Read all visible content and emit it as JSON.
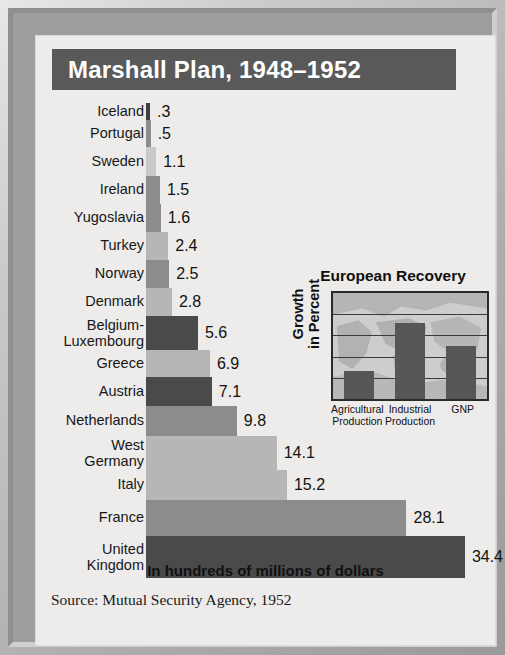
{
  "title": "Marshall Plan, 1948–1952",
  "footer_note": "In hundreds of millions of dollars",
  "source": "Source: Mutual Security Agency, 1952",
  "colors": {
    "title_bar": "#595959",
    "panel": "#edecea",
    "frame": "#9d9d9d",
    "bar_dark": "#4a4a4a",
    "bar_mid": "#8c8c8c",
    "bar_light": "#b6b6b6",
    "bar_pale": "#c9c9c9"
  },
  "inset": {
    "title": "European Recovery",
    "ylabel_line1": "Growth",
    "ylabel_line2": "in Percent"
  },
  "chart_data": [
    {
      "type": "bar",
      "orientation": "horizontal",
      "title": "Marshall Plan, 1948–1952",
      "xlabel": "In hundreds of millions of dollars",
      "ylabel": "",
      "xlim": [
        0,
        34.4
      ],
      "grid": false,
      "legend": "none",
      "categories": [
        "Iceland",
        "Portugal",
        "Sweden",
        "Ireland",
        "Yugoslavia",
        "Turkey",
        "Norway",
        "Denmark",
        "Belgium-Luxembourg",
        "Greece",
        "Austria",
        "Netherlands",
        "West Germany",
        "Italy",
        "France",
        "United Kingdom"
      ],
      "values": [
        0.3,
        0.5,
        1.1,
        1.5,
        1.6,
        2.4,
        2.5,
        2.8,
        5.6,
        6.9,
        7.1,
        9.8,
        14.1,
        15.2,
        28.1,
        34.4
      ],
      "value_labels": [
        ".3",
        ".5",
        "1.1",
        "1.5",
        "1.6",
        "2.4",
        "2.5",
        "2.8",
        "5.6",
        "6.9",
        "7.1",
        "9.8",
        "14.1",
        "15.2",
        "28.1",
        "34.4"
      ]
    },
    {
      "type": "bar",
      "orientation": "vertical",
      "title": "European Recovery",
      "xlabel": "",
      "ylabel": "Growth in Percent",
      "categories": [
        "Agricultural Production",
        "Industrial Production",
        "GNP"
      ],
      "values": [
        13,
        36,
        25
      ],
      "ylim": [
        0,
        50
      ],
      "yticks": [
        0,
        10,
        20,
        30,
        40,
        50
      ],
      "grid": true,
      "legend": "none"
    }
  ],
  "rows": [
    {
      "label": "Iceland",
      "label2": "",
      "value": ".3",
      "tone": "tn-vdark",
      "h": 17
    },
    {
      "label": "Portugal",
      "label2": "",
      "value": ".5",
      "tone": "tn-mid",
      "h": 27
    },
    {
      "label": "Sweden",
      "label2": "",
      "value": "1.1",
      "tone": "tn-pale",
      "h": 29
    },
    {
      "label": "Ireland",
      "label2": "",
      "value": "1.5",
      "tone": "tn-mid",
      "h": 28
    },
    {
      "label": "Yugoslavia",
      "label2": "",
      "value": "1.6",
      "tone": "tn-mid",
      "h": 28
    },
    {
      "label": "Turkey",
      "label2": "",
      "value": "2.4",
      "tone": "tn-light",
      "h": 28
    },
    {
      "label": "Norway",
      "label2": "",
      "value": "2.5",
      "tone": "tn-mid",
      "h": 28
    },
    {
      "label": "Denmark",
      "label2": "",
      "value": "2.8",
      "tone": "tn-light",
      "h": 28
    },
    {
      "label": "Belgium-",
      "label2": "Luxembourg",
      "value": "5.6",
      "tone": "tn-dark",
      "h": 34
    },
    {
      "label": "Greece",
      "label2": "",
      "value": "6.9",
      "tone": "tn-light",
      "h": 27
    },
    {
      "label": "Austria",
      "label2": "",
      "value": "7.1",
      "tone": "tn-dark",
      "h": 29
    },
    {
      "label": "Netherlands",
      "label2": "",
      "value": "9.8",
      "tone": "tn-mid",
      "h": 30
    },
    {
      "label": "West",
      "label2": "Germany",
      "value": "14.1",
      "tone": "tn-light",
      "h": 34
    },
    {
      "label": "Italy",
      "label2": "",
      "value": "15.2",
      "tone": "tn-light",
      "h": 30
    },
    {
      "label": "France",
      "label2": "",
      "value": "28.1",
      "tone": "tn-mid",
      "h": 36
    },
    {
      "label": "United",
      "label2": "Kingdom",
      "value": "34.4",
      "tone": "tn-dark",
      "h": 42
    }
  ],
  "inset_bars": [
    {
      "label1": "Agricultural",
      "label2": "Production",
      "value": 13
    },
    {
      "label1": "Industrial",
      "label2": "Production",
      "value": 36
    },
    {
      "label1": "GNP",
      "label2": "",
      "value": 25
    }
  ],
  "inset_yticks": [
    "50",
    "40",
    "30",
    "20",
    "10",
    "0"
  ]
}
